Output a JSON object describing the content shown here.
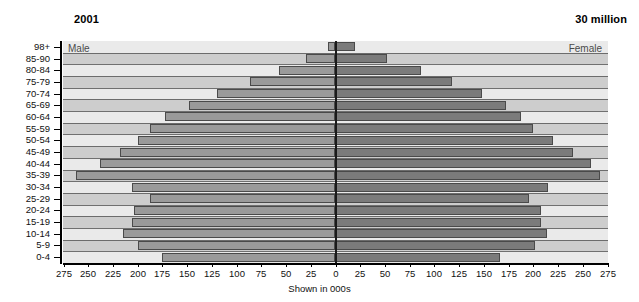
{
  "header": {
    "year": "2001",
    "total": "30 million"
  },
  "chart_data": {
    "type": "bar",
    "subtype": "population-pyramid",
    "title": "2001",
    "annotation_total": "30 million",
    "xlabel": "Shown in 000s",
    "ylabel": "",
    "grid": false,
    "legend_position": "inside-top-corners",
    "left_series_label": "Male",
    "right_series_label": "Female",
    "xlim": [
      0,
      275
    ],
    "xticks": [
      275,
      250,
      225,
      200,
      175,
      150,
      125,
      100,
      75,
      50,
      25,
      0,
      25,
      50,
      75,
      100,
      125,
      150,
      175,
      200,
      225,
      250,
      275
    ],
    "xtick_labels": [
      "275",
      "250",
      "225",
      "200",
      "175",
      "150",
      "125",
      "100",
      "75",
      "50",
      "25",
      "0",
      "25",
      "50",
      "75",
      "100",
      "125",
      "150",
      "175",
      "200",
      "225",
      "250",
      "275"
    ],
    "categories": [
      "0-4",
      "5-9",
      "10-14",
      "15-19",
      "20-24",
      "25-29",
      "30-34",
      "35-39",
      "40-44",
      "45-49",
      "50-54",
      "55-59",
      "60-64",
      "65-69",
      "70-74",
      "75-79",
      "80-84",
      "85-90",
      "98+"
    ],
    "categories_axis_order_top_to_bottom": [
      "98+",
      "85-90",
      "80-84",
      "75-79",
      "70-74",
      "65-69",
      "60-64",
      "55-59",
      "50-54",
      "45-49",
      "40-44",
      "35-39",
      "30-34",
      "25-29",
      "20-24",
      "15-19",
      "10-14",
      "5-9",
      "0-4"
    ],
    "series": [
      {
        "name": "Male",
        "color": "#9a9a9a",
        "side": "left",
        "values_top_to_bottom": [
          8,
          30,
          57,
          86,
          120,
          148,
          172,
          188,
          200,
          218,
          238,
          262,
          206,
          188,
          204,
          206,
          215,
          200,
          175
        ]
      },
      {
        "name": "Female",
        "color": "#7b7b7b",
        "side": "right",
        "values_top_to_bottom": [
          20,
          52,
          86,
          118,
          148,
          172,
          188,
          200,
          220,
          240,
          258,
          267,
          215,
          196,
          208,
          208,
          214,
          202,
          166
        ]
      }
    ]
  },
  "axis": {
    "x_title": "Shown in 000s"
  },
  "colors": {
    "band_dark": "#cdcdcd",
    "band_light": "#eaeaea",
    "male_bar": "#9a9a9a",
    "female_bar": "#7b7b7b",
    "axis": "#000000"
  }
}
